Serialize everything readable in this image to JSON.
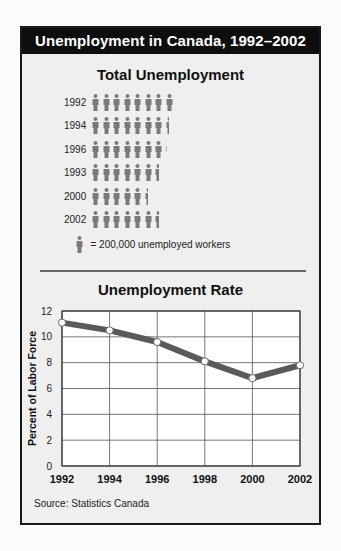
{
  "header": {
    "title": "Unemployment in Canada, 1992–2002"
  },
  "pictograph": {
    "title": "Total Unemployment",
    "rows": [
      {
        "year": "1992",
        "icons": 8.0
      },
      {
        "year": "1994",
        "icons": 7.5
      },
      {
        "year": "1996",
        "icons": 7.2
      },
      {
        "year": "1993",
        "icons": 6.5
      },
      {
        "year": "2000",
        "icons": 5.5
      },
      {
        "year": "2002",
        "icons": 6.5
      }
    ],
    "legend_text": "= 200,000 unemployed workers",
    "icon": "person-icon",
    "icon_color": "#7a7a7a"
  },
  "line_chart": {
    "title": "Unemployment Rate",
    "ylabel": "Percent of Labor Force",
    "source": "Source: Statistics Canada"
  },
  "colors": {
    "header_bg": "#0e0e0e",
    "panel_bg": "#efefef",
    "line": "#5a5a5a",
    "grid": "#555555"
  },
  "chart_data": [
    {
      "type": "bar",
      "subtype": "pictograph",
      "title": "Total Unemployment",
      "categories": [
        "1992",
        "1994",
        "1996",
        "1993",
        "2000",
        "2002"
      ],
      "values_icons": [
        8.0,
        7.5,
        7.2,
        6.5,
        5.5,
        6.5
      ],
      "values": [
        1600000,
        1500000,
        1440000,
        1300000,
        1100000,
        1300000
      ],
      "unit": "1 icon = 200,000 unemployed workers",
      "legend": [
        "= 200,000 unemployed workers"
      ]
    },
    {
      "type": "line",
      "title": "Unemployment Rate",
      "x": [
        "1992",
        "1994",
        "1996",
        "1998",
        "2000",
        "2002"
      ],
      "series": [
        {
          "name": "Unemployment Rate",
          "values": [
            11.1,
            10.5,
            9.6,
            8.1,
            6.8,
            7.8
          ]
        }
      ],
      "xlabel": "",
      "ylabel": "Percent of Labor Force",
      "ylim": [
        0,
        12
      ],
      "yticks": [
        0,
        2,
        4,
        6,
        8,
        10,
        12
      ],
      "xticks": [
        "1992",
        "1994",
        "1996",
        "1998",
        "2000",
        "2002"
      ],
      "grid": true,
      "markers": true,
      "annotations": [
        "Source: Statistics Canada"
      ]
    }
  ]
}
